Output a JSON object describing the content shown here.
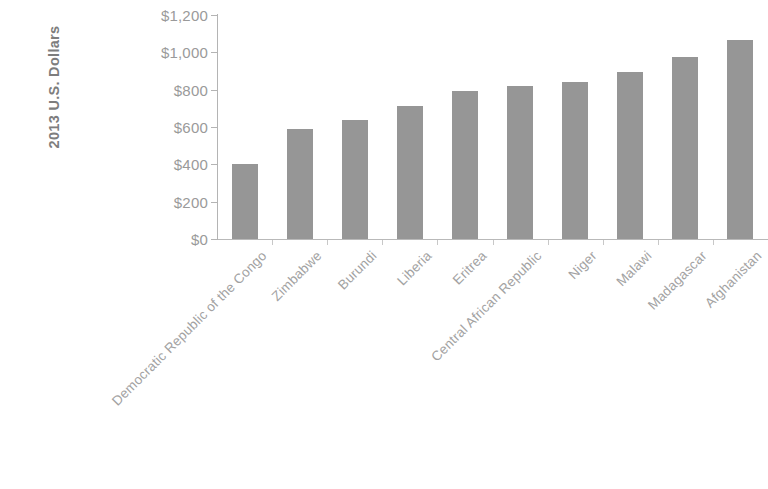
{
  "chart_data": {
    "type": "bar",
    "title": "",
    "subtitle": "",
    "xlabel": "",
    "ylabel": "2013 U.S. Dollars",
    "ylim": [
      0,
      1200
    ],
    "ytick_values": [
      0,
      200,
      400,
      600,
      800,
      1000,
      1200
    ],
    "ytick_labels": [
      "$0",
      "$200",
      "$400",
      "$600",
      "$800",
      "$1,000",
      "$1,200"
    ],
    "grid": false,
    "legend": false,
    "legend_position": "none",
    "bar_color": "#969696",
    "axis_color": "#b4b4b4",
    "text_color": "#9a9a9a",
    "categories": [
      "Democratic Republic of the Congo",
      "Zimbabwe",
      "Burundi",
      "Liberia",
      "Eritrea",
      "Central African Republic",
      "Niger",
      "Malawi",
      "Madagascar",
      "Afghanistan"
    ],
    "values": [
      400,
      590,
      637,
      712,
      792,
      820,
      841,
      894,
      975,
      1066
    ]
  }
}
